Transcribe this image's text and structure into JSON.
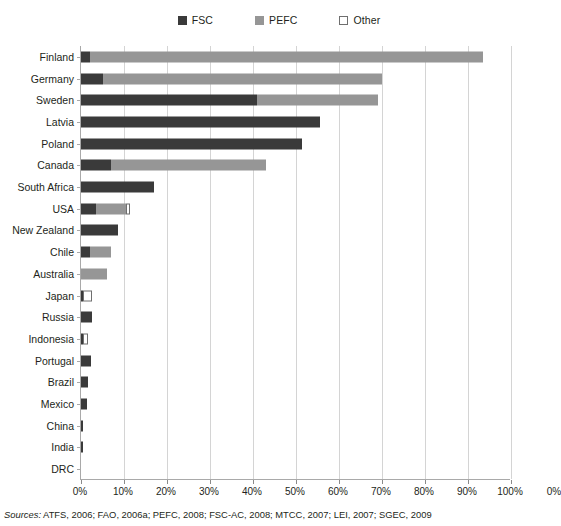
{
  "legend": {
    "items": [
      {
        "label": "FSC",
        "icon": "square-filled-dark-icon",
        "color": "#3a3a3a"
      },
      {
        "label": "PEFC",
        "icon": "square-filled-gray-icon",
        "color": "#969696"
      },
      {
        "label": "Other",
        "icon": "square-outline-white-icon",
        "color": "#ffffff"
      }
    ]
  },
  "source": {
    "lead": "Sources:",
    "text": " ATFS, 2006; FAO, 2006a; PEFC, 2008; FSC-AC, 2008; MTCC, 2007; LEI, 2007; SGEC, 2009"
  },
  "chart_data": {
    "type": "bar",
    "orientation": "horizontal",
    "stacked": true,
    "title": "",
    "subtitle": "",
    "xlabel": "",
    "ylabel": "",
    "xlim": [
      0,
      100
    ],
    "xticks": [
      "0%",
      "10%",
      "20%",
      "30%",
      "40%",
      "50%",
      "60%",
      "70%",
      "80%",
      "90%",
      "100%"
    ],
    "xtick_values": [
      0,
      10,
      20,
      30,
      40,
      50,
      60,
      70,
      80,
      90,
      100
    ],
    "extra_right_label": "0%",
    "grid": "vertical",
    "legend_position": "top-center",
    "unit": "percent of forest area certified",
    "series": [
      {
        "name": "FSC",
        "color": "#3a3a3a",
        "values": [
          2.0,
          5.0,
          41.0,
          55.5,
          51.5,
          7.0,
          17.0,
          3.5,
          8.5,
          2.0,
          0.0,
          0.4,
          2.6,
          0.4,
          2.3,
          1.6,
          1.4,
          0.3,
          0.3,
          0.0
        ]
      },
      {
        "name": "PEFC",
        "color": "#969696",
        "values": [
          91.5,
          65.0,
          28.0,
          0.0,
          0.0,
          36.0,
          0.0,
          7.0,
          0.0,
          5.0,
          6.0,
          0.0,
          0.0,
          0.0,
          0.0,
          0.0,
          0.0,
          0.0,
          0.0,
          0.0
        ]
      },
      {
        "name": "Other",
        "color": "#ffffff",
        "values": [
          0.0,
          0.0,
          0.0,
          0.0,
          0.0,
          0.0,
          0.0,
          0.8,
          0.0,
          0.0,
          0.0,
          2.2,
          0.0,
          1.3,
          0.0,
          0.0,
          0.0,
          0.0,
          0.0,
          0.0
        ]
      }
    ],
    "categories": [
      "Finland",
      "Germany",
      "Sweden",
      "Latvia",
      "Poland",
      "Canada",
      "South Africa",
      "USA",
      "New Zealand",
      "Chile",
      "Australia",
      "Japan",
      "Russia",
      "Indonesia",
      "Portugal",
      "Brazil",
      "Mexico",
      "China",
      "India",
      "DRC"
    ],
    "rows": [
      {
        "category": "Finland",
        "fsc": 2.0,
        "pefc": 91.5,
        "other": 0.0,
        "total": 93.5
      },
      {
        "category": "Germany",
        "fsc": 5.0,
        "pefc": 65.0,
        "other": 0.0,
        "total": 70.0
      },
      {
        "category": "Sweden",
        "fsc": 41.0,
        "pefc": 28.0,
        "other": 0.0,
        "total": 69.0
      },
      {
        "category": "Latvia",
        "fsc": 55.5,
        "pefc": 0.0,
        "other": 0.0,
        "total": 55.5
      },
      {
        "category": "Poland",
        "fsc": 51.5,
        "pefc": 0.0,
        "other": 0.0,
        "total": 51.5
      },
      {
        "category": "Canada",
        "fsc": 7.0,
        "pefc": 36.0,
        "other": 0.0,
        "total": 43.0
      },
      {
        "category": "South Africa",
        "fsc": 17.0,
        "pefc": 0.0,
        "other": 0.0,
        "total": 17.0
      },
      {
        "category": "USA",
        "fsc": 3.5,
        "pefc": 7.0,
        "other": 0.8,
        "total": 11.3
      },
      {
        "category": "New Zealand",
        "fsc": 8.5,
        "pefc": 0.0,
        "other": 0.0,
        "total": 8.5
      },
      {
        "category": "Chile",
        "fsc": 2.0,
        "pefc": 5.0,
        "other": 0.0,
        "total": 7.0
      },
      {
        "category": "Australia",
        "fsc": 0.0,
        "pefc": 6.0,
        "other": 0.0,
        "total": 6.0
      },
      {
        "category": "Japan",
        "fsc": 0.4,
        "pefc": 0.0,
        "other": 2.2,
        "total": 2.6
      },
      {
        "category": "Russia",
        "fsc": 2.6,
        "pefc": 0.0,
        "other": 0.0,
        "total": 2.6
      },
      {
        "category": "Indonesia",
        "fsc": 0.4,
        "pefc": 0.0,
        "other": 1.3,
        "total": 1.7
      },
      {
        "category": "Portugal",
        "fsc": 2.3,
        "pefc": 0.0,
        "other": 0.0,
        "total": 2.3
      },
      {
        "category": "Brazil",
        "fsc": 1.6,
        "pefc": 0.0,
        "other": 0.0,
        "total": 1.6
      },
      {
        "category": "Mexico",
        "fsc": 1.4,
        "pefc": 0.0,
        "other": 0.0,
        "total": 1.4
      },
      {
        "category": "China",
        "fsc": 0.3,
        "pefc": 0.0,
        "other": 0.0,
        "total": 0.3
      },
      {
        "category": "India",
        "fsc": 0.3,
        "pefc": 0.0,
        "other": 0.0,
        "total": 0.3
      },
      {
        "category": "DRC",
        "fsc": 0.0,
        "pefc": 0.0,
        "other": 0.0,
        "total": 0.0
      }
    ]
  }
}
